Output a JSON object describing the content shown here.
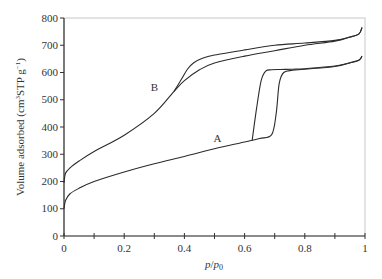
{
  "chart_data": {
    "type": "line",
    "title": "",
    "xlabel": "p/p0",
    "xlabel_parts": {
      "main": "p",
      "sep": "/",
      "sub_main": "p",
      "sub": "0"
    },
    "ylabel": "Volume adsorbed (cm3STP g-1)",
    "ylabel_parts": {
      "pre": "Volume adsorbed (cm",
      "sup1": "3",
      "mid": "STP g",
      "sup2": "−1",
      "post": ")"
    },
    "xlim": [
      0,
      1
    ],
    "ylim": [
      0,
      800
    ],
    "x_ticks": [
      0,
      0.2,
      0.4,
      0.6,
      0.8,
      1
    ],
    "x_tick_labels": [
      "0",
      "0.2",
      "0.4",
      "0.6",
      "0.8",
      "1"
    ],
    "x_minor_ticks": [
      0.1,
      0.3,
      0.5,
      0.7,
      0.9
    ],
    "y_ticks": [
      0,
      100,
      200,
      300,
      400,
      500,
      600,
      700,
      800
    ],
    "y_tick_labels": [
      "0",
      "100",
      "200",
      "300",
      "400",
      "500",
      "600",
      "700",
      "800"
    ],
    "grid": false,
    "legend": "none (curves labeled inline)",
    "annotations": [
      {
        "text": "A",
        "x": 0.51,
        "y": 360
      },
      {
        "text": "B",
        "x": 0.3,
        "y": 545
      }
    ],
    "series": [
      {
        "name": "A (adsorption)",
        "x": [
          0,
          0.005,
          0.02,
          0.05,
          0.1,
          0.2,
          0.3,
          0.4,
          0.5,
          0.6,
          0.65,
          0.69,
          0.705,
          0.715,
          0.73,
          0.76,
          0.8,
          0.9,
          0.95,
          0.98,
          0.99
        ],
        "y": [
          100,
          130,
          155,
          175,
          200,
          235,
          265,
          292,
          320,
          345,
          358,
          372,
          450,
          560,
          600,
          608,
          612,
          622,
          635,
          645,
          660
        ]
      },
      {
        "name": "A (desorption)",
        "x": [
          0.625,
          0.64,
          0.655,
          0.67,
          0.69,
          0.72,
          0.76,
          0.8,
          0.9,
          0.95,
          0.98,
          0.99
        ],
        "y": [
          350,
          470,
          570,
          605,
          610,
          611,
          612,
          614,
          624,
          636,
          646,
          660
        ]
      },
      {
        "name": "B (adsorption)",
        "x": [
          0,
          0.005,
          0.02,
          0.05,
          0.1,
          0.2,
          0.3,
          0.365,
          0.4,
          0.45,
          0.5,
          0.6,
          0.7,
          0.8,
          0.9,
          0.95,
          0.98,
          0.99
        ],
        "y": [
          195,
          230,
          250,
          275,
          310,
          370,
          450,
          530,
          570,
          610,
          635,
          660,
          680,
          700,
          715,
          730,
          742,
          765
        ]
      },
      {
        "name": "B (desorption)",
        "x": [
          0.365,
          0.39,
          0.41,
          0.43,
          0.46,
          0.5,
          0.6,
          0.7,
          0.8,
          0.9,
          0.95,
          0.98,
          0.99
        ],
        "y": [
          530,
          575,
          612,
          635,
          652,
          664,
          683,
          700,
          708,
          718,
          730,
          742,
          765
        ]
      }
    ]
  }
}
